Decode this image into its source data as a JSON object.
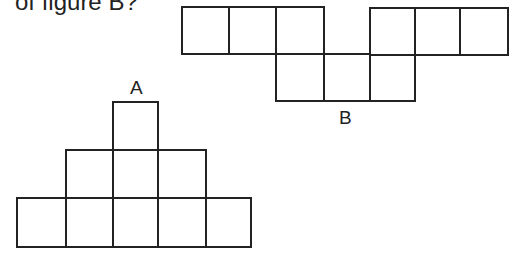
{
  "question": {
    "text": "of figure B?"
  },
  "figures": {
    "A": {
      "label": "A",
      "stroke": "#222222",
      "squares": [
        {
          "x": 113,
          "y": 102,
          "w": 45,
          "h": 48
        },
        {
          "x": 66,
          "y": 150,
          "w": 47,
          "h": 48
        },
        {
          "x": 113,
          "y": 150,
          "w": 45,
          "h": 48
        },
        {
          "x": 158,
          "y": 150,
          "w": 48,
          "h": 48
        },
        {
          "x": 17,
          "y": 198,
          "w": 49,
          "h": 49
        },
        {
          "x": 66,
          "y": 198,
          "w": 47,
          "h": 49
        },
        {
          "x": 113,
          "y": 198,
          "w": 45,
          "h": 49
        },
        {
          "x": 158,
          "y": 198,
          "w": 48,
          "h": 49
        },
        {
          "x": 206,
          "y": 198,
          "w": 45,
          "h": 49
        }
      ]
    },
    "B": {
      "label": "B",
      "stroke": "#222222",
      "squares": [
        {
          "x": 182,
          "y": 7,
          "w": 47,
          "h": 47
        },
        {
          "x": 229,
          "y": 7,
          "w": 47,
          "h": 47
        },
        {
          "x": 276,
          "y": 7,
          "w": 48,
          "h": 47
        },
        {
          "x": 370,
          "y": 8,
          "w": 45,
          "h": 47
        },
        {
          "x": 415,
          "y": 8,
          "w": 45,
          "h": 47
        },
        {
          "x": 460,
          "y": 8,
          "w": 48,
          "h": 47
        },
        {
          "x": 276,
          "y": 54,
          "w": 48,
          "h": 47
        },
        {
          "x": 324,
          "y": 54,
          "w": 46,
          "h": 47
        },
        {
          "x": 370,
          "y": 55,
          "w": 45,
          "h": 46
        }
      ]
    }
  }
}
